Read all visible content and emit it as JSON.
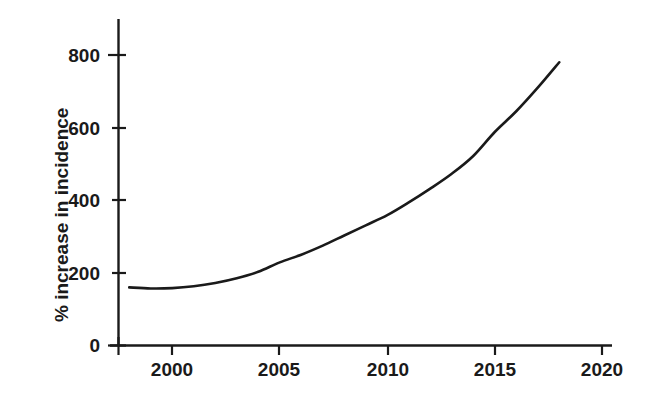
{
  "chart_data": {
    "type": "line",
    "title": "",
    "subtitle": "",
    "xlabel": "",
    "ylabel": "% increase in incidence",
    "xlim": [
      1997.5,
      2021.0
    ],
    "ylim": [
      0,
      880
    ],
    "xticks": [
      2000,
      2005,
      2010,
      2015,
      2020
    ],
    "xtick_labels": [
      "2000",
      "2005",
      "2010",
      "2015",
      "2020"
    ],
    "yticks": [
      0,
      200,
      400,
      600,
      800
    ],
    "ytick_labels": [
      "0",
      "200",
      "400",
      "600",
      "800"
    ],
    "grid": false,
    "legend": null,
    "annotations": [],
    "series": [
      {
        "name": "% increase in incidence",
        "color": "#1a1a1a",
        "line_width": 2.6,
        "markers": false,
        "x": [
          1998,
          1999,
          2000,
          2001,
          2002,
          2003,
          2004,
          2005,
          2006,
          2007,
          2008,
          2009,
          2010,
          2011,
          2012,
          2013,
          2014,
          2015,
          2016,
          2017,
          2018
        ],
        "y": [
          160,
          157,
          158,
          163,
          172,
          185,
          203,
          229,
          250,
          275,
          303,
          331,
          359,
          394,
          432,
          473,
          522,
          588,
          645,
          710,
          780
        ]
      }
    ]
  },
  "axes": {
    "y_axis_label": "% increase in incidence",
    "y_tick_labels": [
      "800",
      "600",
      "400",
      "200",
      "0"
    ],
    "x_tick_labels": [
      "2000",
      "2005",
      "2010",
      "2015",
      "2020"
    ],
    "axis_color": "#1a1a1a",
    "background_color": "#ffffff"
  }
}
